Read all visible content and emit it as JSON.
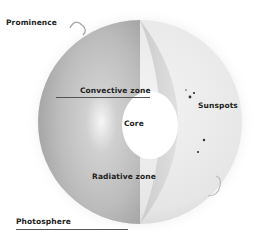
{
  "diagram": {
    "labels": {
      "prominence": "Prominence",
      "convective_zone": "Convective zone",
      "core": "Core",
      "sunspots": "Sunspots",
      "radiative_zone": "Radiative zone",
      "photosphere": "Photosphere"
    },
    "colors": {
      "background": "#ffffff",
      "label_text": "#222222",
      "sphere_surface": "#e9e9e9",
      "interior_shade": "#b8b8b8",
      "core": "#ffffff",
      "sunspot": "#333333"
    }
  }
}
